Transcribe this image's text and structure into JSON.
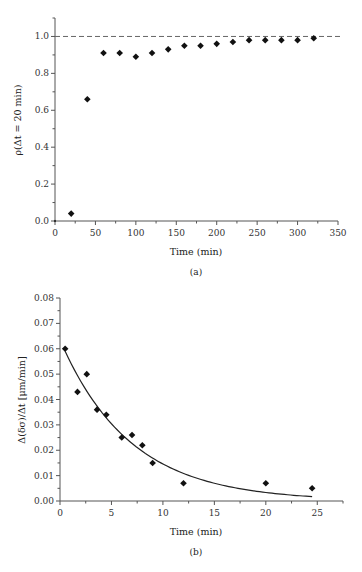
{
  "chart_data": [
    {
      "type": "scatter",
      "panel": "(a)",
      "xlabel": "Time (min)",
      "ylabel": "ρ(Δt = 20 min)",
      "xlim": [
        0,
        350
      ],
      "ylim": [
        0,
        1.1
      ],
      "xticks": [
        0,
        50,
        100,
        150,
        200,
        250,
        300,
        350
      ],
      "xtick_labels": [
        "0",
        "50",
        "100",
        "150",
        "200",
        "250",
        "300",
        "350"
      ],
      "yticks": [
        0.0,
        0.2,
        0.4,
        0.6,
        0.8,
        1.0
      ],
      "ytick_labels": [
        "0.0",
        "0.2",
        "0.4",
        "0.6",
        "0.8",
        "1.0"
      ],
      "reference_line": {
        "y": 1.0,
        "style": "dashed"
      },
      "series": [
        {
          "name": "ρ",
          "marker": "diamond",
          "x": [
            0,
            20,
            40,
            60,
            80,
            100,
            120,
            140,
            160,
            180,
            200,
            220,
            240,
            260,
            280,
            300,
            320
          ],
          "y": [
            0.0,
            0.04,
            0.66,
            0.91,
            0.91,
            0.89,
            0.91,
            0.93,
            0.95,
            0.95,
            0.96,
            0.97,
            0.98,
            0.98,
            0.98,
            0.98,
            0.99
          ]
        }
      ],
      "grid": false
    },
    {
      "type": "scatter",
      "panel": "(b)",
      "xlabel": "Time (min)",
      "ylabel": "Δ(δσ)/Δt [μm/min]",
      "xlim": [
        0,
        27.5
      ],
      "ylim": [
        0,
        0.08
      ],
      "xticks": [
        0,
        5,
        10,
        15,
        20,
        25
      ],
      "xtick_labels": [
        "0",
        "5",
        "10",
        "15",
        "20",
        "25"
      ],
      "yticks": [
        0.0,
        0.01,
        0.02,
        0.03,
        0.04,
        0.05,
        0.06,
        0.07,
        0.08
      ],
      "ytick_labels": [
        "0.00",
        "0.01",
        "0.02",
        "0.03",
        "0.04",
        "0.05",
        "0.06",
        "0.07",
        "0.08"
      ],
      "series": [
        {
          "name": "data",
          "marker": "diamond",
          "x": [
            0.5,
            1.7,
            2.6,
            3.6,
            4.5,
            6.0,
            7.0,
            8.0,
            9.0,
            12.0,
            20.0,
            24.5
          ],
          "y": [
            0.06,
            0.043,
            0.05,
            0.036,
            0.034,
            0.025,
            0.026,
            0.022,
            0.015,
            0.007,
            0.007,
            0.005
          ]
        },
        {
          "name": "exponential fit",
          "line": "solid",
          "model": "y = A*exp(-x/tau)",
          "A": 0.0635,
          "tau": 6.8,
          "x_range": [
            0.5,
            24.5
          ]
        }
      ],
      "grid": false
    }
  ]
}
